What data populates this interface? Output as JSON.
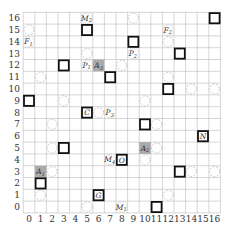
{
  "grid": {
    "x_ticks": [
      "0",
      "1",
      "2",
      "3",
      "4",
      "5",
      "6",
      "7",
      "8",
      "9",
      "10",
      "11",
      "12",
      "13",
      "14",
      "15",
      "16"
    ],
    "y_ticks": [
      "0",
      "1",
      "2",
      "3",
      "4",
      "5",
      "6",
      "7",
      "8",
      "9",
      "10",
      "11",
      "12",
      "13",
      "14",
      "15",
      "16"
    ],
    "colors": {
      "grid": "#bbbbbb",
      "square": "#111111",
      "circle": "#bbbbbb",
      "shaded": "#aaaaaa"
    }
  },
  "squares": [
    {
      "x": 5,
      "y": 15,
      "label": ""
    },
    {
      "x": 9,
      "y": 14,
      "label": ""
    },
    {
      "x": 16,
      "y": 16,
      "label": ""
    },
    {
      "x": 13,
      "y": 13,
      "label": ""
    },
    {
      "x": 3,
      "y": 12,
      "label": ""
    },
    {
      "x": 7,
      "y": 11,
      "label": ""
    },
    {
      "x": 12,
      "y": 10,
      "label": ""
    },
    {
      "x": 0,
      "y": 9,
      "label": ""
    },
    {
      "x": 5,
      "y": 8,
      "label": "C"
    },
    {
      "x": 10,
      "y": 7,
      "label": ""
    },
    {
      "x": 15,
      "y": 6,
      "label": "N"
    },
    {
      "x": 3,
      "y": 5,
      "label": ""
    },
    {
      "x": 8,
      "y": 4,
      "label": "O"
    },
    {
      "x": 13,
      "y": 3,
      "label": ""
    },
    {
      "x": 1,
      "y": 2,
      "label": ""
    },
    {
      "x": 6,
      "y": 1,
      "label": "G"
    },
    {
      "x": 11,
      "y": 0,
      "label": ""
    }
  ],
  "circles": [
    {
      "x": 0,
      "y": 15
    },
    {
      "x": 9,
      "y": 16
    },
    {
      "x": 12,
      "y": 14
    },
    {
      "x": 5,
      "y": 13
    },
    {
      "x": 8,
      "y": 12
    },
    {
      "x": 1,
      "y": 11
    },
    {
      "x": 12,
      "y": 11
    },
    {
      "x": 14,
      "y": 10
    },
    {
      "x": 16,
      "y": 10
    },
    {
      "x": 3,
      "y": 9
    },
    {
      "x": 10,
      "y": 9
    },
    {
      "x": 6,
      "y": 8
    },
    {
      "x": 2,
      "y": 7
    },
    {
      "x": 2,
      "y": 5
    },
    {
      "x": 11,
      "y": 7
    },
    {
      "x": 7,
      "y": 4
    },
    {
      "x": 2,
      "y": 3
    },
    {
      "x": 11,
      "y": 5
    },
    {
      "x": 10,
      "y": 4
    },
    {
      "x": 14,
      "y": 3
    },
    {
      "x": 16,
      "y": 3
    },
    {
      "x": 12,
      "y": 1
    },
    {
      "x": 1,
      "y": 1
    },
    {
      "x": 5,
      "y": 0
    }
  ],
  "shaded": [
    {
      "x": 6,
      "y": 12,
      "label": "A3"
    },
    {
      "x": 1,
      "y": 3,
      "label": "A1"
    },
    {
      "x": 10,
      "y": 5,
      "label": "A2"
    }
  ],
  "labels": [
    {
      "x": 5,
      "y": 16,
      "text": "M2"
    },
    {
      "x": 0,
      "y": 14,
      "text": "F1"
    },
    {
      "x": 12,
      "y": 15,
      "text": "F2"
    },
    {
      "x": 9,
      "y": 13,
      "text": "P2"
    },
    {
      "x": 5,
      "y": 12,
      "text": "P1"
    },
    {
      "x": 7,
      "y": 8,
      "text": "P3"
    },
    {
      "x": 7,
      "y": 4,
      "text": "M4"
    },
    {
      "x": 8,
      "y": 0,
      "text": "M1"
    }
  ]
}
